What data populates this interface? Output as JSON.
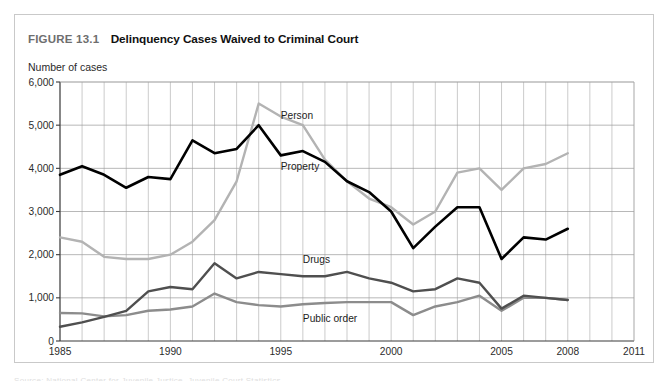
{
  "figure": {
    "number": "FIGURE 13.1",
    "title": "Delinquency Cases Waived to Criminal Court",
    "axis_caption": "Number of cases"
  },
  "chart_data": {
    "type": "line",
    "title": "Delinquency Cases Waived to Criminal Court",
    "xlabel": "",
    "ylabel": "Number of cases",
    "xlim": [
      1985,
      2011
    ],
    "ylim": [
      0,
      6000
    ],
    "ytick_labels": [
      "0",
      "1,000",
      "2,000",
      "3,000",
      "4,000",
      "5,000",
      "6,000"
    ],
    "ytick_values": [
      0,
      1000,
      2000,
      3000,
      4000,
      5000,
      6000
    ],
    "xtick_labels": [
      "1985",
      "1990",
      "1995",
      "2000",
      "2005",
      "2008",
      "2011"
    ],
    "xtick_values": [
      1985,
      1990,
      1995,
      2000,
      2005,
      2008,
      2011
    ],
    "grid": true,
    "legend_position": "inline-annotations",
    "x": [
      1985,
      1986,
      1987,
      1988,
      1989,
      1990,
      1991,
      1992,
      1993,
      1994,
      1995,
      1996,
      1997,
      1998,
      1999,
      2000,
      2001,
      2002,
      2003,
      2004,
      2005,
      2006,
      2007,
      2008
    ],
    "series": [
      {
        "name": "Person",
        "color": "#b3b3b3",
        "label_x": 1995,
        "label_y": 5150,
        "values": [
          2400,
          2300,
          1950,
          1900,
          1900,
          2000,
          2300,
          2800,
          3700,
          5500,
          5200,
          5000,
          4200,
          3700,
          3300,
          3100,
          2700,
          3000,
          3900,
          4000,
          3500,
          4000,
          4100,
          4350
        ]
      },
      {
        "name": "Property",
        "color": "#000000",
        "label_x": 1995,
        "label_y": 3950,
        "values": [
          3850,
          4050,
          3850,
          3550,
          3800,
          3750,
          4650,
          4350,
          4450,
          5000,
          4300,
          4400,
          4150,
          3700,
          3450,
          3000,
          2150,
          2650,
          3100,
          3100,
          1900,
          2400,
          2350,
          2600
        ]
      },
      {
        "name": "Drugs",
        "color": "#4f4f4f",
        "label_x": 1996,
        "label_y": 1800,
        "values": [
          330,
          430,
          560,
          700,
          1150,
          1250,
          1200,
          1800,
          1450,
          1600,
          1550,
          1500,
          1500,
          1600,
          1450,
          1350,
          1150,
          1200,
          1450,
          1350,
          750,
          1050,
          1000,
          950
        ]
      },
      {
        "name": "Public order",
        "color": "#8c8c8c",
        "label_x": 1996,
        "label_y": 430,
        "values": [
          650,
          640,
          570,
          600,
          700,
          730,
          800,
          1100,
          900,
          830,
          800,
          850,
          880,
          900,
          900,
          900,
          600,
          800,
          900,
          1050,
          700,
          1000,
          1000,
          950
        ]
      }
    ]
  },
  "footer": {
    "cut_text": "Source: National Center for Juvenile Justice, Juvenile Court Statistics"
  }
}
